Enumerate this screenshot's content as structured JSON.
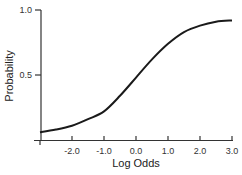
{
  "chart_data": {
    "type": "line",
    "title": "",
    "xlabel": "Log Odds",
    "ylabel": "Probability",
    "xlim": [
      -3.0,
      3.0
    ],
    "ylim": [
      0.0,
      1.0
    ],
    "grid": false,
    "x_ticks": [
      "-2.0",
      "-1.0",
      "0.0",
      "1.0",
      "2.0",
      "3.0"
    ],
    "y_ticks": [
      "0.5",
      "1.0"
    ],
    "series": [
      {
        "name": "Probability",
        "x": [
          -3.0,
          -2.5,
          -2.0,
          -1.5,
          -1.0,
          -0.5,
          0.0,
          0.5,
          1.0,
          1.5,
          2.0,
          2.5,
          3.0
        ],
        "values": [
          0.06,
          0.08,
          0.11,
          0.16,
          0.22,
          0.34,
          0.48,
          0.62,
          0.74,
          0.83,
          0.88,
          0.91,
          0.92
        ]
      }
    ]
  }
}
